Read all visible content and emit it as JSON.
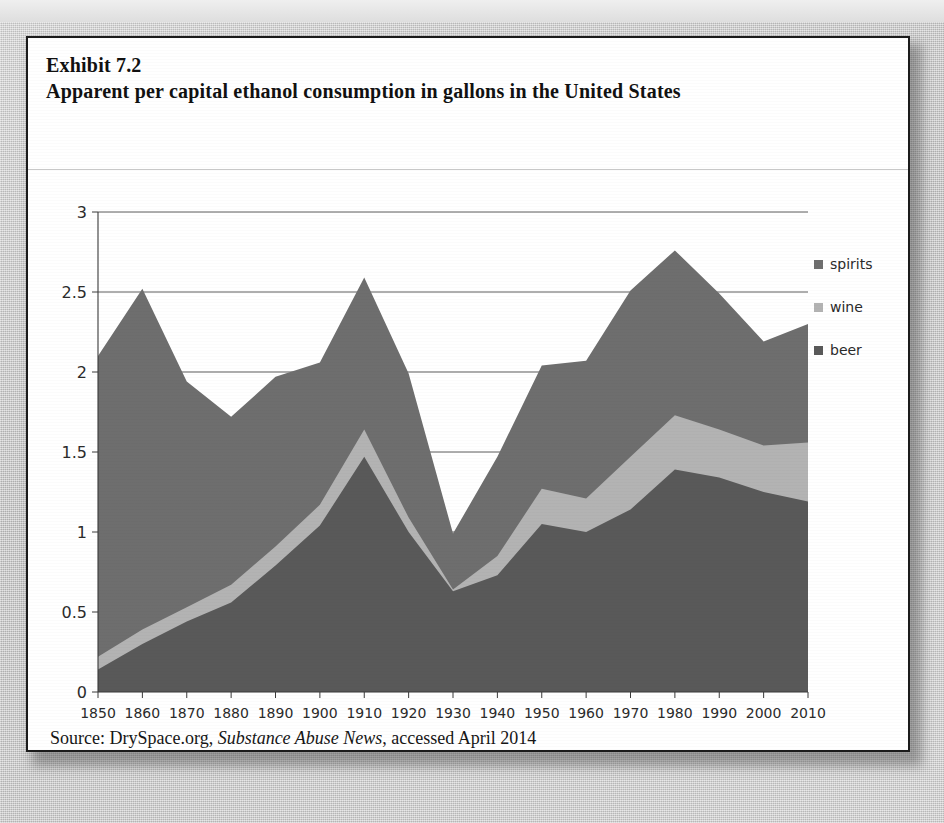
{
  "exhibit": {
    "number": "Exhibit 7.2",
    "title": "Apparent per capital ethanol consumption in gallons in the United States"
  },
  "source_note": {
    "prefix": "Source: DrySpace.org, ",
    "italic": "Substance Abuse News",
    "suffix": ", accessed April 2014"
  },
  "legend": {
    "items": [
      {
        "label": "spirits",
        "color": "#6e6e6e"
      },
      {
        "label": "wine",
        "color": "#b3b3b3"
      },
      {
        "label": "beer",
        "color": "#595959"
      }
    ]
  },
  "axes": {
    "y_ticks": [
      "0",
      "0.5",
      "1",
      "1.5",
      "2",
      "2.5",
      "3"
    ],
    "x_ticks": [
      "1850",
      "1860",
      "1870",
      "1880",
      "1890",
      "1900",
      "1910",
      "1920",
      "1930",
      "1940",
      "1950",
      "1960",
      "1970",
      "1980",
      "1990",
      "2000",
      "2010"
    ]
  },
  "chart_data": {
    "type": "area",
    "stacked": true,
    "title": "Apparent per capital ethanol consumption in gallons in the United States",
    "xlabel": "",
    "ylabel": "",
    "ylim": [
      0,
      3
    ],
    "ytick_step": 0.5,
    "grid": "horizontal",
    "legend_position": "right",
    "x": [
      1850,
      1860,
      1870,
      1880,
      1890,
      1900,
      1910,
      1920,
      1930,
      1940,
      1950,
      1960,
      1970,
      1980,
      1990,
      2000,
      2010
    ],
    "series": [
      {
        "name": "beer",
        "color": "#595959",
        "values": [
          0.14,
          0.3,
          0.44,
          0.56,
          0.79,
          1.04,
          1.47,
          1.0,
          0.63,
          0.73,
          1.05,
          1.0,
          1.14,
          1.39,
          1.34,
          1.25,
          1.19
        ]
      },
      {
        "name": "wine",
        "color": "#b3b3b3",
        "values": [
          0.08,
          0.09,
          0.09,
          0.11,
          0.12,
          0.13,
          0.17,
          0.09,
          0.01,
          0.12,
          0.22,
          0.21,
          0.33,
          0.34,
          0.3,
          0.29,
          0.37
        ]
      },
      {
        "name": "spirits",
        "color": "#6e6e6e",
        "values": [
          1.88,
          2.13,
          1.41,
          1.05,
          1.06,
          0.89,
          0.95,
          0.9,
          0.35,
          0.62,
          0.77,
          0.86,
          1.04,
          1.03,
          0.85,
          0.65,
          0.74
        ]
      }
    ],
    "totals": [
      2.1,
      2.52,
      1.94,
      1.72,
      1.97,
      2.06,
      2.59,
      1.99,
      0.99,
      1.47,
      2.04,
      2.07,
      2.51,
      2.76,
      2.49,
      2.19,
      2.3
    ]
  }
}
